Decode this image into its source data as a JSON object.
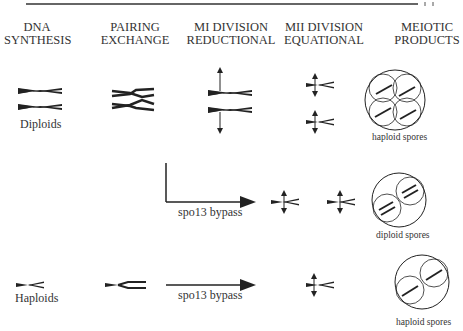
{
  "header": {
    "columns": [
      {
        "line1": "DNA",
        "line2": "SYNTHESIS"
      },
      {
        "line1": "PAIRING",
        "line2": "EXCHANGE"
      },
      {
        "line1": "MI DIVISION",
        "line2": "REDUCTIONAL"
      },
      {
        "line1": "MII DIVISION",
        "line2": "EQUATIONAL"
      },
      {
        "line1": "MEIOTIC",
        "line2": "PRODUCTS"
      }
    ]
  },
  "rows": [
    {
      "start_label": "Diploids",
      "product_label": "haploid spores"
    },
    {
      "bypass_label": "spo13 bypass",
      "product_label": "diploid spores"
    },
    {
      "start_label": "Haploids",
      "bypass_label": "spo13 bypass",
      "product_label": "haploid spores"
    }
  ],
  "colors": {
    "ink": "#222222",
    "background": "#ffffff"
  }
}
